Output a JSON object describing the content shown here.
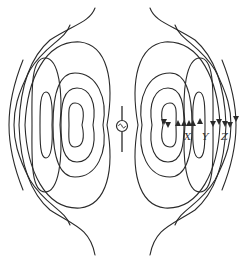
{
  "figure": {
    "source_symbol": "AC source (~ in circle)",
    "labels": [
      {
        "id": "X",
        "text": "X",
        "x": 186,
        "y": 132
      },
      {
        "id": "Y",
        "text": "Y",
        "x": 202,
        "y": 132
      },
      {
        "id": "Z",
        "text": "Z",
        "x": 222,
        "y": 132
      }
    ],
    "caption": "",
    "colors": {
      "line": "#2a2a2a",
      "background": "#ffffff"
    },
    "icons": {
      "source": "ac-source-icon",
      "arrow": "arrowhead-icon"
    }
  }
}
